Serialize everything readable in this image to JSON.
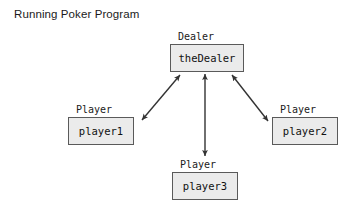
{
  "diagram": {
    "title": "Running Poker Program",
    "background_color": "#ffffff",
    "box_fill_color": "#ebebeb",
    "box_border_color": "#5a5a5a",
    "text_color": "#1b1b1b",
    "arrow_color": "#333333",
    "nodes": [
      {
        "id": "dealer",
        "type_label": "Dealer",
        "instance_label": "theDealer",
        "box": {
          "x": 170,
          "y": 44,
          "w": 74,
          "h": 28
        },
        "type_label_pos": {
          "x": 178,
          "y": 31
        }
      },
      {
        "id": "player1",
        "type_label": "Player",
        "instance_label": "player1",
        "box": {
          "x": 68,
          "y": 117,
          "w": 66,
          "h": 28
        },
        "type_label_pos": {
          "x": 76,
          "y": 104
        }
      },
      {
        "id": "player2",
        "type_label": "Player",
        "instance_label": "player2",
        "box": {
          "x": 272,
          "y": 117,
          "w": 66,
          "h": 28
        },
        "type_label_pos": {
          "x": 280,
          "y": 104
        }
      },
      {
        "id": "player3",
        "type_label": "Player",
        "instance_label": "player3",
        "box": {
          "x": 172,
          "y": 172,
          "w": 66,
          "h": 28
        },
        "type_label_pos": {
          "x": 180,
          "y": 159
        }
      }
    ],
    "connections": [
      {
        "id": "dealer-player1",
        "from": "dealer",
        "to": "player1",
        "style": "double-headed-arrow",
        "x1": 180,
        "y1": 75,
        "x2": 142,
        "y2": 120
      },
      {
        "id": "dealer-player3",
        "from": "dealer",
        "to": "player3",
        "style": "double-headed-arrow",
        "x1": 205,
        "y1": 74,
        "x2": 205,
        "y2": 156
      },
      {
        "id": "dealer-player2",
        "from": "dealer",
        "to": "player2",
        "style": "double-headed-arrow",
        "x1": 232,
        "y1": 75,
        "x2": 268,
        "y2": 121
      }
    ]
  }
}
